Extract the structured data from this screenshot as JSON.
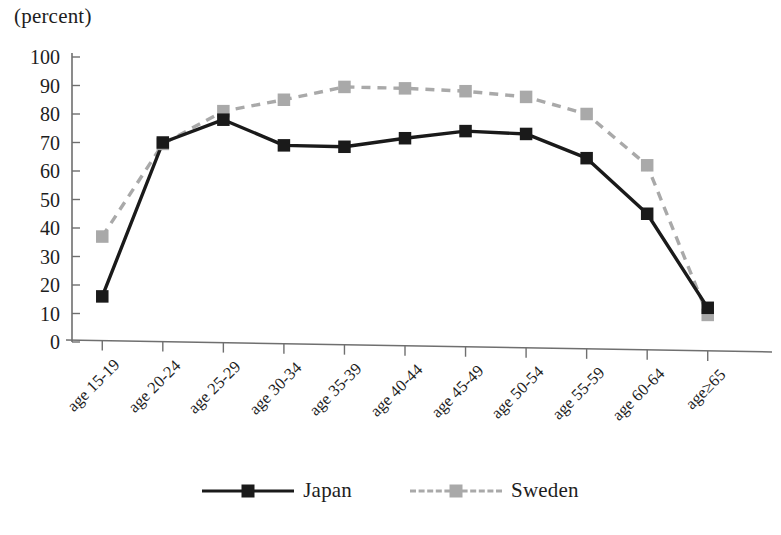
{
  "chart_data": {
    "type": "line",
    "title": "",
    "unit_label": "(percent)",
    "xlabel": "",
    "ylabel": "(percent)",
    "ylim": [
      0,
      100
    ],
    "ytick_step": 10,
    "yticks": [
      "100",
      "90",
      "80",
      "70",
      "60",
      "50",
      "40",
      "30",
      "20",
      "10",
      "0"
    ],
    "grid": false,
    "legend_position": "bottom-center",
    "categories": [
      "age 15-19",
      "age 20-24",
      "age 25-29",
      "age 30-34",
      "age 35-39",
      "age 40-44",
      "age 45-49",
      "age 50-54",
      "age 55-59",
      "age 60-64",
      "age≥65"
    ],
    "series": [
      {
        "name": "Japan",
        "color": "#1a1a1a",
        "line_style": "solid",
        "marker": "square",
        "values": [
          16,
          70,
          78,
          69,
          68.5,
          71.5,
          74,
          73,
          64.5,
          45,
          12
        ]
      },
      {
        "name": "Sweden",
        "color": "#a9a9a9",
        "line_style": "dashed",
        "marker": "square",
        "values": [
          37,
          69.5,
          81,
          85,
          89.5,
          89,
          88,
          86,
          80,
          62,
          9.5
        ]
      }
    ]
  },
  "legend": {
    "items": [
      {
        "label": "Japan",
        "color": "#1a1a1a",
        "style": "solid"
      },
      {
        "label": "Sweden",
        "color": "#a9a9a9",
        "style": "dashed"
      }
    ]
  },
  "colors": {
    "japan": "#1a1a1a",
    "sweden": "#a9a9a9",
    "axis": "#6f6f6f",
    "text": "#1d1d1d",
    "background": "#ffffff"
  }
}
